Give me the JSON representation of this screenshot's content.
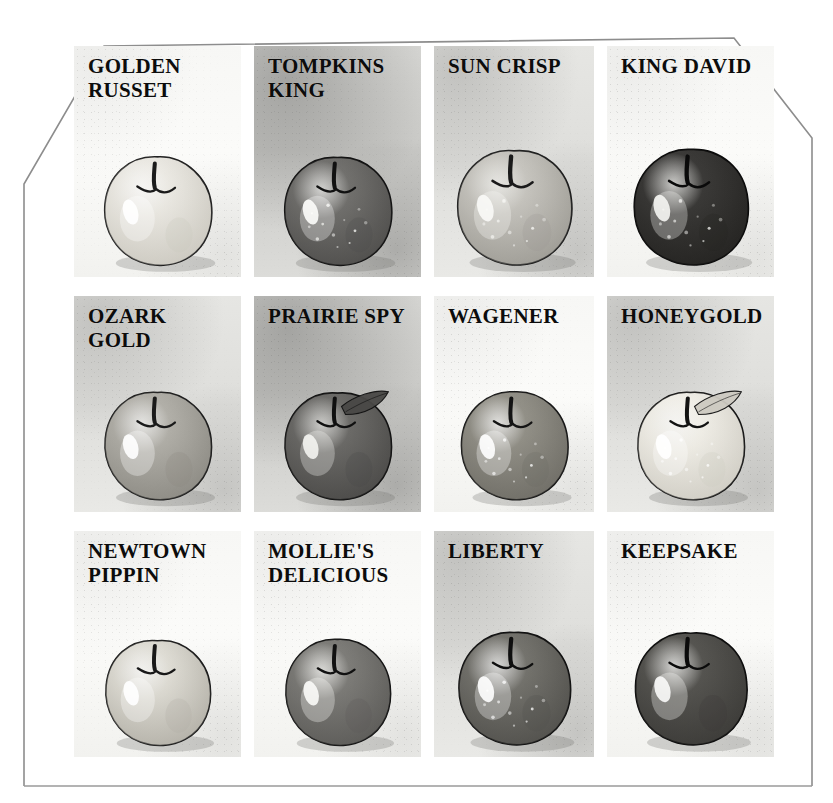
{
  "plate": {
    "title": "Apple Varieties",
    "frame_style": "chamfered-top-corners",
    "background_color": "#ffffff",
    "frame_line_color": "#8d8d8d",
    "columns": 4,
    "rows": 3
  },
  "varieties": [
    {
      "id": "golden-russet",
      "label": "GOLDEN\nRUSSET",
      "lines": 2,
      "paper": "light",
      "body_color": "#eceae4",
      "shade_color": "#c9c6bd",
      "outline_color": "#1b1b1b",
      "highlight_color": "#ffffff",
      "speckles": false,
      "leaf": false,
      "row": 1,
      "col": 1
    },
    {
      "id": "tompkins-king",
      "label": "TOMPKINS\nKING",
      "lines": 2,
      "paper": "dark",
      "body_color": "#73726f",
      "shade_color": "#4d4c4a",
      "outline_color": "#111111",
      "highlight_color": "#fdfdfb",
      "speckles": true,
      "leaf": false,
      "row": 1,
      "col": 2
    },
    {
      "id": "sun-crisp",
      "label": "SUN CRISP",
      "lines": 1,
      "paper": "mid",
      "body_color": "#c8c6c0",
      "shade_color": "#9b9992",
      "outline_color": "#1a1a1a",
      "highlight_color": "#fafaf7",
      "speckles": true,
      "leaf": false,
      "row": 1,
      "col": 3
    },
    {
      "id": "king-david",
      "label": "KING DAVID",
      "lines": 1,
      "paper": "light",
      "body_color": "#3c3b39",
      "shade_color": "#232220",
      "outline_color": "#0a0a0a",
      "highlight_color": "#f6f6f3",
      "speckles": true,
      "leaf": false,
      "row": 1,
      "col": 4
    },
    {
      "id": "ozark-gold",
      "label": "OZARK GOLD",
      "lines": 1,
      "paper": "mid",
      "body_color": "#b3b1aa",
      "shade_color": "#8a8881",
      "outline_color": "#1a1a1a",
      "highlight_color": "#ffffff",
      "speckles": false,
      "leaf": false,
      "row": 2,
      "col": 1
    },
    {
      "id": "prairie-spy",
      "label": "PRAIRIE SPY",
      "lines": 1,
      "paper": "dark",
      "body_color": "#6e6d6a",
      "shade_color": "#494846",
      "outline_color": "#101010",
      "highlight_color": "#f4f4f1",
      "speckles": false,
      "leaf": true,
      "row": 2,
      "col": 2
    },
    {
      "id": "wagener",
      "label": "WAGENER",
      "lines": 1,
      "paper": "light",
      "body_color": "#949289",
      "shade_color": "#6d6b64",
      "outline_color": "#141414",
      "highlight_color": "#ffffff",
      "speckles": true,
      "leaf": false,
      "row": 2,
      "col": 3
    },
    {
      "id": "honeygold",
      "label": "HONEYGOLD",
      "lines": 1,
      "paper": "mid",
      "body_color": "#f1efe8",
      "shade_color": "#cdcac1",
      "outline_color": "#131313",
      "highlight_color": "#ffffff",
      "speckles": true,
      "leaf": true,
      "row": 2,
      "col": 4
    },
    {
      "id": "newtown-pippin",
      "label": "NEWTOWN\nPIPPIN",
      "lines": 2,
      "paper": "light",
      "body_color": "#e0ded6",
      "shade_color": "#b0ada4",
      "outline_color": "#181818",
      "highlight_color": "#ffffff",
      "speckles": false,
      "leaf": false,
      "row": 3,
      "col": 1
    },
    {
      "id": "mollies-delicious",
      "label": "MOLLIE'S\nDELICIOUS",
      "lines": 2,
      "paper": "light",
      "body_color": "#7f7e7a",
      "shade_color": "#5a5956",
      "outline_color": "#111111",
      "highlight_color": "#fbfbf8",
      "speckles": false,
      "leaf": false,
      "row": 3,
      "col": 2
    },
    {
      "id": "liberty",
      "label": "LIBERTY",
      "lines": 1,
      "paper": "mid",
      "body_color": "#76756f",
      "shade_color": "#4f4e4a",
      "outline_color": "#0f0f0f",
      "highlight_color": "#ffffff",
      "speckles": true,
      "leaf": false,
      "row": 3,
      "col": 3
    },
    {
      "id": "keepsake",
      "label": "KEEPSAKE",
      "lines": 1,
      "paper": "light",
      "body_color": "#575652",
      "shade_color": "#3a3936",
      "outline_color": "#0b0b0b",
      "highlight_color": "#fbfbf9",
      "speckles": false,
      "leaf": false,
      "row": 3,
      "col": 4
    }
  ]
}
